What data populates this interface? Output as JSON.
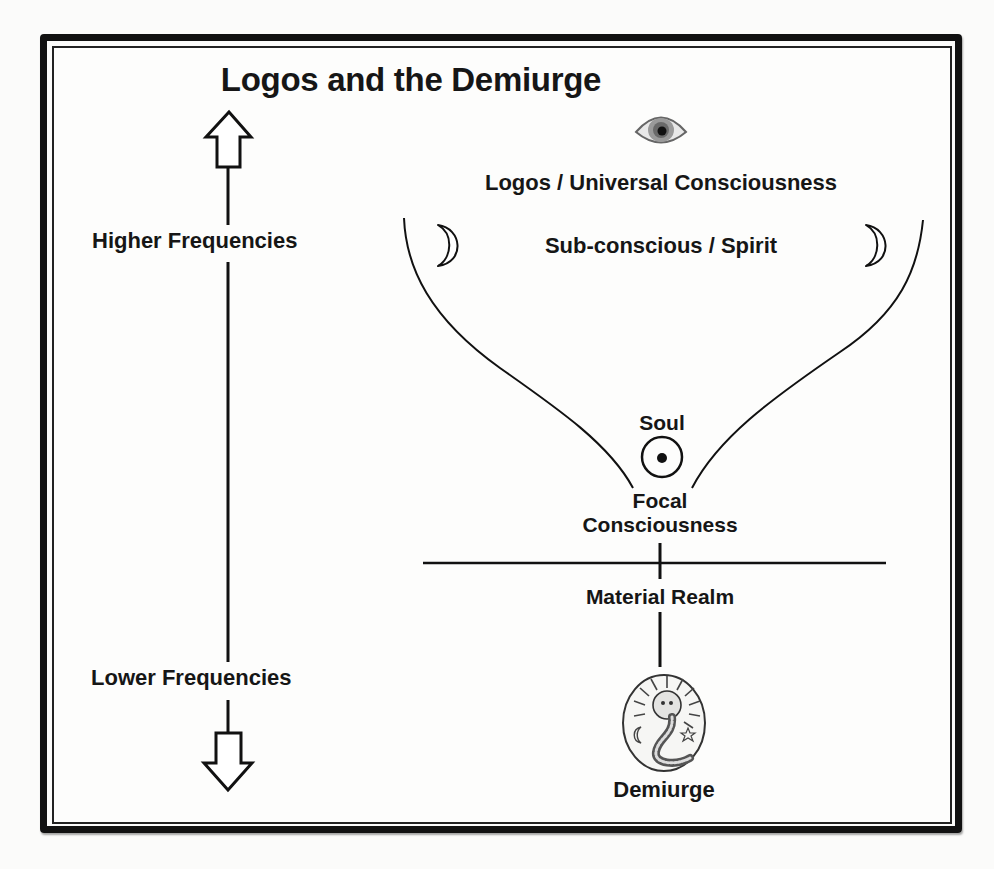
{
  "title": "Logos and the Demiurge",
  "axis": {
    "higher_label": "Higher Frequencies",
    "lower_label": "Lower Frequencies",
    "up_arrow_icon": "hollow-up-arrow",
    "down_arrow_icon": "hollow-down-arrow"
  },
  "levels": {
    "logos": {
      "label": "Logos / Universal Consciousness",
      "icon": "eye-icon"
    },
    "subconscious": {
      "label": "Sub-conscious / Spirit",
      "icons": [
        "crescent-moon-icon",
        "crescent-moon-icon"
      ]
    },
    "soul": {
      "label": "Soul",
      "icon": "circumpunct-sun-icon"
    },
    "focal": {
      "label_line1": "Focal",
      "label_line2": "Consciousness"
    },
    "material": {
      "label": "Material Realm"
    },
    "demiurge": {
      "label": "Demiurge",
      "icon": "lion-headed-serpent-emblem-icon"
    }
  },
  "colors": {
    "ink": "#141414",
    "background": "#fbfbfa",
    "frame": "#111111"
  }
}
